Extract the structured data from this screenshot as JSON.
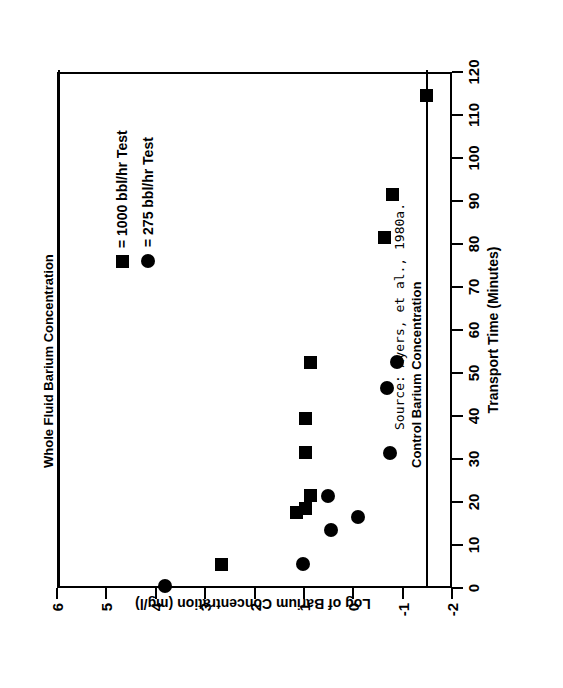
{
  "figure": {
    "rotation_note": "figure printed rotated 90 degrees counter-clockwise on page",
    "source_caption": "Source:  Ayers, et al., 1980a."
  },
  "legend": {
    "items": [
      {
        "marker": "square",
        "label": "= 1000 bbl/hr Test"
      },
      {
        "marker": "circle",
        "label": "= 275 bbl/hr Test"
      }
    ]
  },
  "annotations": [
    {
      "name": "whole-fluid-barium-concentration",
      "label": "Whole Fluid Barium Concentration",
      "value": 6.0
    },
    {
      "name": "control-barium-concentration",
      "label": "Control Barium Concentration",
      "value": -1.45
    }
  ],
  "chart_data": {
    "type": "scatter",
    "title": "",
    "xlabel": "Transport Time (Minutes)",
    "ylabel": "Log of Barium Concentration (mg/l)",
    "xlim": [
      0,
      120
    ],
    "ylim": [
      -2,
      6
    ],
    "xticks": [
      0,
      10,
      20,
      30,
      40,
      50,
      60,
      70,
      80,
      90,
      100,
      110,
      120
    ],
    "yticks": [
      6,
      5,
      4,
      3,
      2,
      1,
      0,
      -1,
      -2
    ],
    "grid": false,
    "legend_position": "upper-right",
    "series": [
      {
        "name": "1000 bbl/hr Test",
        "marker": "square",
        "color": "#000000",
        "points": [
          [
            5,
            2.7
          ],
          [
            17,
            1.2
          ],
          [
            18,
            1.0
          ],
          [
            21,
            0.9
          ],
          [
            31,
            1.0
          ],
          [
            39,
            1.0
          ],
          [
            52,
            0.9
          ],
          [
            81,
            -0.6
          ],
          [
            91,
            -0.75
          ],
          [
            114,
            -1.45
          ]
        ]
      },
      {
        "name": "275 bbl/hr Test",
        "marker": "circle",
        "color": "#000000",
        "points": [
          [
            0,
            3.85
          ],
          [
            5,
            1.05
          ],
          [
            13,
            0.5
          ],
          [
            16,
            -0.05
          ],
          [
            21,
            0.55
          ],
          [
            31,
            -0.7
          ],
          [
            46,
            -0.65
          ],
          [
            52,
            -0.85
          ]
        ]
      }
    ]
  }
}
